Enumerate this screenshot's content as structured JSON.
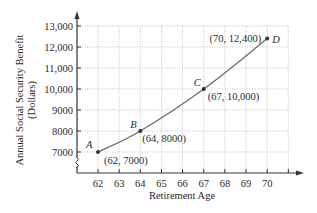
{
  "chart_data": {
    "type": "line",
    "title": "",
    "xlabel": "Retirement Age",
    "ylabel_line1": "Annual Social Security Benefit",
    "ylabel_line2": "(Dollars)",
    "x_ticks": [
      62,
      63,
      64,
      65,
      66,
      67,
      68,
      69,
      70
    ],
    "x_tick_labels": [
      "62",
      "63",
      "64",
      "65",
      "66",
      "67",
      "68",
      "69",
      "70"
    ],
    "y_ticks": [
      7000,
      8000,
      9000,
      10000,
      11000,
      12000,
      13000
    ],
    "y_tick_labels": [
      "7000",
      "8000",
      "9000",
      "10,000",
      "11,000",
      "12,000",
      "13,000"
    ],
    "xlim": [
      61,
      71
    ],
    "ylim": [
      6000,
      13000
    ],
    "grid": true,
    "axis_break_y": true,
    "series": [
      {
        "name": "Benefit",
        "points": [
          {
            "label": "A",
            "x": 62,
            "y": 7000,
            "coord_text": "(62, 7000)"
          },
          {
            "label": "B",
            "x": 64,
            "y": 8000,
            "coord_text": "(64, 8000)"
          },
          {
            "label": "C",
            "x": 67,
            "y": 10000,
            "coord_text": "(67, 10,000)"
          },
          {
            "label": "D",
            "x": 70,
            "y": 12400,
            "coord_text": "(70, 12,400)"
          }
        ]
      }
    ],
    "colors": {
      "line": "#6b6b6b",
      "axis": "#333333",
      "grid": "#b5b5b5",
      "point": "#333333"
    }
  }
}
